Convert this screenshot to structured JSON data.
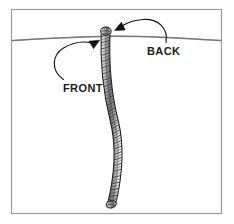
{
  "figure": {
    "type": "illustration-diagram",
    "background_color": "#ffffff",
    "border_color": "#9a9a9a",
    "frame": {
      "x": 11,
      "y": 9,
      "width": 211,
      "height": 205
    }
  },
  "annotations": {
    "front": {
      "label": "FRONT",
      "text_color": "#1c1c1c",
      "arrow_color": "#111111",
      "arrow_tip": {
        "x": 98,
        "y": 42
      },
      "arrow_direction": "up-right",
      "curve": "sweeps from lower-left upward to tube top-left side"
    },
    "back": {
      "label": "BACK",
      "text_color": "#1c1c1c",
      "arrow_color": "#111111",
      "arrow_tip": {
        "x": 114,
        "y": 30
      },
      "arrow_direction": "left-down",
      "curve": "arcs from lower-right up and over to tube top-right side"
    }
  },
  "surface_line": {
    "name": "horizontal-surface-line",
    "color": "#7d7d7d",
    "left_point": {
      "x": 12,
      "y": 40
    },
    "mid_point": {
      "x": 110,
      "y": 36
    },
    "right_point": {
      "x": 221,
      "y": 40
    }
  },
  "tube": {
    "name": "coiled-flexible-tube",
    "outline_color": "#2b2b2b",
    "fill_color": "#d8d8d8",
    "coil_color": "#3a3a3a",
    "top_tip": {
      "x": 106,
      "y": 29
    },
    "bottom_tip": {
      "x": 111,
      "y": 206
    },
    "width_top": 11,
    "width_bottom": 8,
    "coil_count": 58,
    "shape": "S-curve bowing right then returning left"
  }
}
